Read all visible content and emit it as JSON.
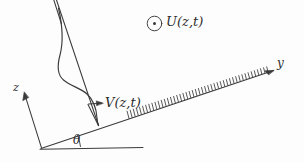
{
  "figure": {
    "background_color": "#fdfdfd",
    "ink_color": "#3a3a3a",
    "width": 304,
    "height": 162
  },
  "axes": {
    "z_axis": {
      "label": "z",
      "icon": "arrow-up-left-icon",
      "origin": [
        42,
        148
      ],
      "tip": [
        24,
        92
      ]
    },
    "y_axis": {
      "label": "y",
      "icon": "arrow-up-right-icon",
      "origin": [
        42,
        148
      ],
      "tip": [
        274,
        70
      ]
    },
    "horizontal_reference": {
      "name": "horizontal-datum-line",
      "from": [
        40,
        149
      ],
      "to": [
        143,
        148
      ]
    }
  },
  "angle": {
    "label": "θ",
    "description": "slope inclination angle between horizontal datum and inclined plane"
  },
  "profile": {
    "velocity_label": "V(z,t)",
    "arrow_icon": "arrow-right-icon",
    "description": "S-shaped along-slope velocity profile V(z,t) plotted normal to the inclined surface"
  },
  "out_of_plane": {
    "symbol_icon": "circled-dot-icon",
    "label": "U(z,t)",
    "description": "cross-slope velocity component directed out of the page"
  },
  "surface": {
    "name": "inclined-hatched-surface",
    "hatch_icon": "hatching-icon",
    "hatch_count": 46,
    "description": "hatched inclined ground surface running along the y axis"
  }
}
